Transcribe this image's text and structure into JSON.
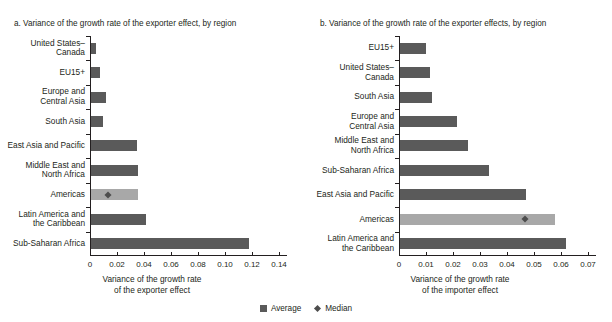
{
  "legend": {
    "average_label": "Average",
    "median_label": "Median"
  },
  "colors": {
    "average": "#5a5a5a",
    "highlight": "#a8a8a8",
    "median": "#4d4d4d",
    "axis": "#231f20"
  },
  "chart_data": [
    {
      "type": "bar",
      "panel": "a",
      "title": "a. Variance of the growth rate of the exporter effect, by region",
      "orientation": "horizontal",
      "xlabel": "Variance of the growth rate\nof the exporter effect",
      "ylabel": "",
      "xlim": [
        0,
        0.14
      ],
      "xticks": [
        0,
        0.02,
        0.04,
        0.06,
        0.08,
        0.1,
        0.12,
        0.14
      ],
      "xticklabels": [
        "0",
        "0.02",
        "0.04",
        "0.06",
        "0.08",
        "0.10",
        "0.12",
        "0.14"
      ],
      "grid": false,
      "legend_position": "bottom-center",
      "categories": [
        "United States–\nCanada",
        "EU15+",
        "Europe and\nCentral Asia",
        "South Asia",
        "East Asia and Pacific",
        "Middle East and\nNorth Africa",
        "Americas",
        "Latin America and\nthe Caribbean",
        "Sub-Saharan Africa"
      ],
      "values": [
        0.004,
        0.007,
        0.011,
        0.009,
        0.034,
        0.035,
        0.035,
        0.041,
        0.117
      ],
      "highlight_index": 6,
      "median": {
        "category": "Americas",
        "value": 0.013
      }
    },
    {
      "type": "bar",
      "panel": "b",
      "title": "b. Variance of the growth rate of the exporter effects, by region",
      "orientation": "horizontal",
      "xlabel": "Variance of the growth rate\nof the importer effect",
      "ylabel": "",
      "xlim": [
        0,
        0.07
      ],
      "xticks": [
        0,
        0.01,
        0.02,
        0.03,
        0.04,
        0.05,
        0.06,
        0.07
      ],
      "xticklabels": [
        "0",
        "0.01",
        "0.02",
        "0.03",
        "0.04",
        "0.05",
        "0.06",
        "0.07"
      ],
      "grid": false,
      "legend_position": "bottom-center",
      "categories": [
        "EU15+",
        "United States–\nCanada",
        "South Asia",
        "Europe and\nCentral Asia",
        "Middle East and\nNorth Africa",
        "Sub-Saharan Africa",
        "East Asia and Pacific",
        "Americas",
        "Latin America and\nthe Caribbean"
      ],
      "values": [
        0.0095,
        0.011,
        0.012,
        0.021,
        0.025,
        0.033,
        0.0465,
        0.0575,
        0.0615
      ],
      "highlight_index": 7,
      "median": {
        "category": "Americas",
        "value": 0.0465
      }
    }
  ]
}
